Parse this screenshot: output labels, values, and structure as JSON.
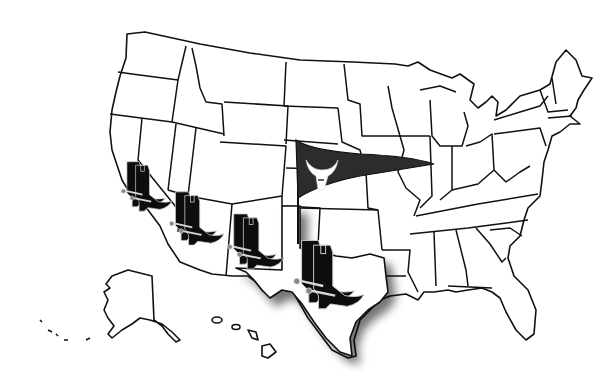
{
  "image": {
    "title": "United States map with cowboy boots and longhorn pennant",
    "background": "#ffffff",
    "line_color": "#111111"
  },
  "map": {
    "region": "United States",
    "insets": [
      "Alaska",
      "Hawaii"
    ],
    "highlighted_state": "Texas",
    "highlight_style": "drop shadow",
    "states_with_boots": [
      "California",
      "Arizona",
      "New Mexico",
      "Texas"
    ]
  },
  "icons": {
    "boots": [
      {
        "name": "cowboy-boots-icon",
        "location": "California",
        "x": 138,
        "y": 185
      },
      {
        "name": "cowboy-boots-icon",
        "location": "Arizona",
        "x": 190,
        "y": 215
      },
      {
        "name": "cowboy-boots-icon",
        "location": "New Mexico",
        "x": 250,
        "y": 245
      },
      {
        "name": "cowboy-boots-icon",
        "location": "Texas",
        "x": 330,
        "y": 275
      }
    ],
    "pennant": {
      "name": "pennant-flag-icon",
      "color": "#2a2a2a",
      "emblem": "longhorn-skull",
      "pole_base_state": "Texas panhandle"
    }
  }
}
